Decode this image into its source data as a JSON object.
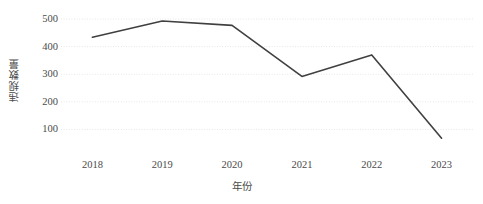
{
  "chart_data": {
    "type": "line",
    "title": "",
    "subtitle": "",
    "xlabel": "年份",
    "ylabel": "违规数量",
    "categories": [
      "2018",
      "2019",
      "2020",
      "2021",
      "2022",
      "2023"
    ],
    "x": [
      2018,
      2019,
      2020,
      2021,
      2022,
      2023
    ],
    "values": [
      434,
      493,
      477,
      292,
      370,
      68
    ],
    "series": [
      {
        "name": "违规数量",
        "values": [
          434,
          493,
          477,
          292,
          370,
          68
        ],
        "color": "#404040",
        "line_width": 1.6,
        "markers": false
      }
    ],
    "ylim": [
      0,
      540
    ],
    "xlim": [
      2017.55,
      2023.45
    ],
    "yticks": [
      100,
      200,
      300,
      400,
      500
    ],
    "ytick_labels": [
      "100",
      "200",
      "300",
      "400",
      "500"
    ],
    "xticks": [
      2018,
      2019,
      2020,
      2021,
      2022,
      2023
    ],
    "xtick_labels": [
      "2018",
      "2019",
      "2020",
      "2021",
      "2022",
      "2023"
    ],
    "grid": {
      "horizontal": true,
      "vertical": false,
      "color": "#e6e6e6",
      "style": "dotted"
    },
    "legend": {
      "visible": false,
      "position": "none",
      "entries": []
    },
    "annotations": [],
    "background_color": "#ffffff",
    "axis_label_color": "#4a4a4a"
  },
  "axes": {
    "y_title": "违规数量",
    "x_title": "年份"
  }
}
